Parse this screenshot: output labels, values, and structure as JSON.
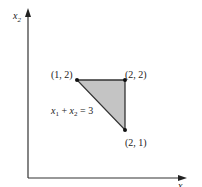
{
  "diagram": {
    "type": "feasible-region",
    "axes": {
      "x_label": "x",
      "x_label_sub": "1",
      "y_label": "x",
      "y_label_sub": "2"
    },
    "region": {
      "fill": "#c4c4c4",
      "stroke": "#333333",
      "vertices": [
        {
          "x": 1,
          "y": 2,
          "label": "(1, 2)"
        },
        {
          "x": 2,
          "y": 2,
          "label": "(2, 2)"
        },
        {
          "x": 2,
          "y": 1,
          "label": "(2, 1)"
        }
      ]
    },
    "constraint_label": {
      "x1": "x",
      "sub1": "1",
      "plus": " + ",
      "x2": "x",
      "sub2": "2",
      "rhs": " = 3"
    }
  }
}
